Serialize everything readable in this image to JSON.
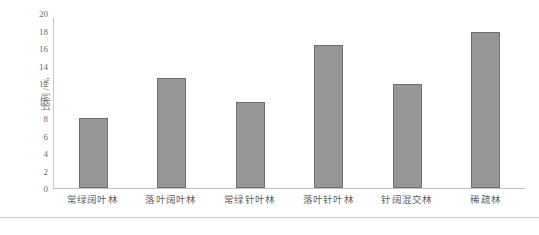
{
  "chart_data": {
    "type": "bar",
    "title": "",
    "subtitle": "",
    "xlabel": "",
    "ylabel": "比例 / %",
    "ylim": [
      0,
      20
    ],
    "ytick_step": 2,
    "yticks": [
      0,
      2,
      4,
      6,
      8,
      10,
      12,
      14,
      16,
      18,
      20
    ],
    "ytick_labels": [
      "0",
      "2",
      "4",
      "6",
      "8",
      "10",
      "12",
      "14",
      "16",
      "18",
      "20"
    ],
    "grid": false,
    "legend": null,
    "legend_position": "none",
    "categories": [
      "常绿阔叶林",
      "落叶阔叶林",
      "常绿针叶林",
      "落叶针叶林",
      "针阔混交林",
      "稀疏林"
    ],
    "values": [
      8.2,
      13.0,
      10.1,
      16.8,
      12.2,
      18.3
    ],
    "series": [
      {
        "name": "比例",
        "values": [
          8.2,
          13.0,
          10.1,
          16.8,
          12.2,
          18.3
        ]
      }
    ],
    "annotations": [],
    "colors": {
      "bar_fill": "#969696",
      "bar_border": "#6f6f6f",
      "axis_line": "#c8c8c8",
      "baseline": "#c0c0c0",
      "tick_text": "#6b6b6b",
      "category_text": "#5f5f5f",
      "background": "#ffffff",
      "rule": "#c9c9c9"
    }
  }
}
